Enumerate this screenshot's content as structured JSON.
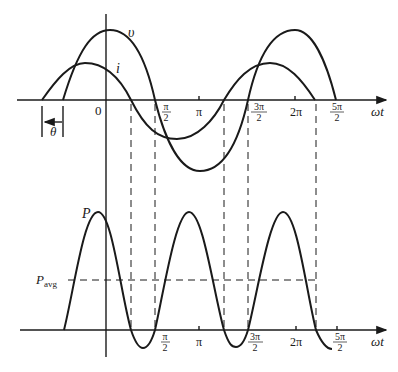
{
  "diagram": {
    "type": "phasor-waveform",
    "colors": {
      "ink": "#1a1a1a",
      "background": "#ffffff"
    },
    "top_plot": {
      "curves": [
        {
          "id": "v",
          "label": "υ"
        },
        {
          "id": "i",
          "label": "i"
        }
      ],
      "origin_label": "0",
      "x_axis_label": "ωt",
      "theta_label": "θ",
      "ticks": [
        {
          "num": "π",
          "den": "2"
        },
        {
          "num": "π",
          "den": ""
        },
        {
          "num": "3π",
          "den": "2"
        },
        {
          "num": "2π",
          "den": ""
        },
        {
          "num": "5π",
          "den": "2"
        }
      ]
    },
    "bottom_plot": {
      "curve_label": "P",
      "avg_label_main": "P",
      "avg_label_sub": "avg",
      "x_axis_label": "ωt",
      "ticks": [
        {
          "num": "π",
          "den": "2"
        },
        {
          "num": "π",
          "den": ""
        },
        {
          "num": "3π",
          "den": "2"
        },
        {
          "num": "2π",
          "den": ""
        },
        {
          "num": "5π",
          "den": "2"
        }
      ]
    }
  }
}
